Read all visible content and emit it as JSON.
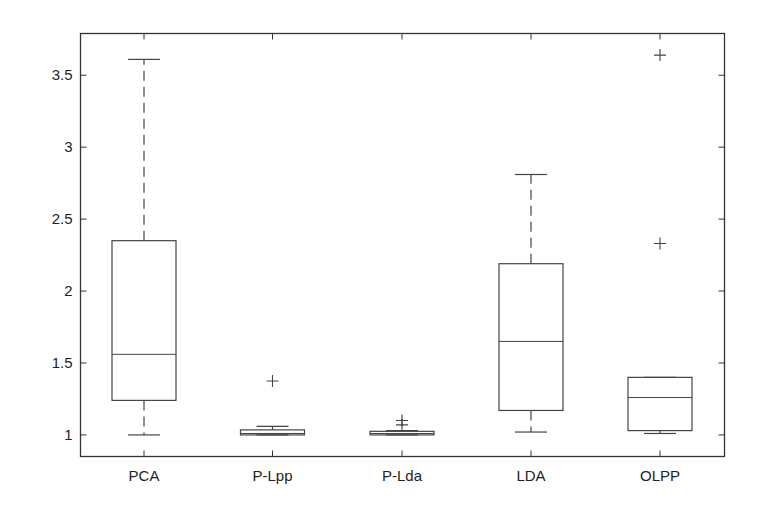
{
  "chart_data": {
    "type": "boxplot",
    "title": "",
    "xlabel": "",
    "ylabel": "",
    "categories": [
      "PCA",
      "P-Lpp",
      "P-Lda",
      "LDA",
      "OLPP"
    ],
    "ylim": [
      0.85,
      3.79
    ],
    "yticks": [
      1,
      1.5,
      2,
      2.5,
      3,
      3.5
    ],
    "ytick_labels": [
      "1",
      "1.5",
      "2",
      "2.5",
      "3",
      "3.5"
    ],
    "grid": false,
    "legend": null,
    "boxes": [
      {
        "name": "PCA",
        "whisker_low": 1.0,
        "q1": 1.24,
        "median": 1.56,
        "q3": 2.35,
        "whisker_high": 3.61,
        "outliers": []
      },
      {
        "name": "P-Lpp",
        "whisker_low": 1.0,
        "q1": 1.0,
        "median": 1.01,
        "q3": 1.035,
        "whisker_high": 1.06,
        "outliers": [
          1.375
        ]
      },
      {
        "name": "P-Lda",
        "whisker_low": 1.0,
        "q1": 1.0,
        "median": 1.01,
        "q3": 1.025,
        "whisker_high": 1.03,
        "outliers": [
          1.07,
          1.1
        ]
      },
      {
        "name": "LDA",
        "whisker_low": 1.02,
        "q1": 1.17,
        "median": 1.65,
        "q3": 2.19,
        "whisker_high": 2.81,
        "outliers": []
      },
      {
        "name": "OLPP",
        "whisker_low": 1.01,
        "q1": 1.03,
        "median": 1.26,
        "q3": 1.4,
        "whisker_high": 1.4,
        "outliers": [
          2.33,
          3.64
        ]
      }
    ]
  },
  "colors": {
    "axis": "#333333",
    "box": "#444444",
    "background": "#ffffff"
  }
}
